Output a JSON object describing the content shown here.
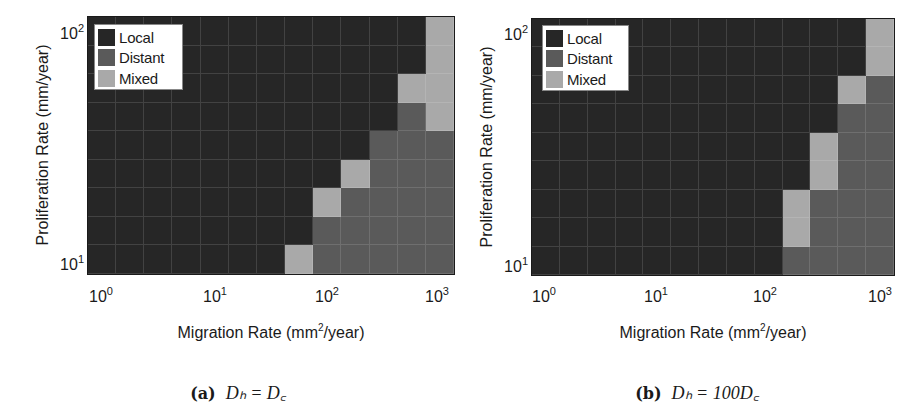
{
  "legend": {
    "items": [
      {
        "label": "Local",
        "color": "#262626",
        "key": "local"
      },
      {
        "label": "Distant",
        "color": "#5a5a5a",
        "key": "distant"
      },
      {
        "label": "Mixed",
        "color": "#a9a9a9",
        "key": "mixed"
      }
    ]
  },
  "panels": [
    {
      "id": "a",
      "caption_tag": "(a)",
      "caption_math": "Dₕ = D꜀",
      "caption_math_text": "D_h = D_c",
      "ylabel": "Proliferation Rate (mm/year)",
      "xlabel_pre": "Migration Rate (mm",
      "xlabel_sup": "2",
      "xlabel_post": "/year)",
      "xticks": [
        {
          "base": "10",
          "exp": "0"
        },
        {
          "base": "10",
          "exp": "1"
        },
        {
          "base": "10",
          "exp": "2"
        },
        {
          "base": "10",
          "exp": "3"
        }
      ],
      "yticks": [
        {
          "base": "10",
          "exp": "2"
        },
        {
          "base": "10",
          "exp": "1"
        }
      ]
    },
    {
      "id": "b",
      "caption_tag": "(b)",
      "caption_math": "Dₕ = 100D꜀",
      "caption_math_text": "D_h = 100 D_c",
      "ylabel": "Proliferation Rate (mm/year)",
      "xlabel_pre": "Migration Rate (mm",
      "xlabel_sup": "2",
      "xlabel_post": "/year)",
      "xticks": [
        {
          "base": "10",
          "exp": "0"
        },
        {
          "base": "10",
          "exp": "1"
        },
        {
          "base": "10",
          "exp": "2"
        },
        {
          "base": "10",
          "exp": "3"
        }
      ],
      "yticks": [
        {
          "base": "10",
          "exp": "2"
        },
        {
          "base": "10",
          "exp": "1"
        }
      ]
    }
  ],
  "chart_data": [
    {
      "type": "heatmap",
      "title": "(a) D_h = D_c",
      "xlabel": "Migration Rate (mm²/year)",
      "ylabel": "Proliferation Rate (mm/year)",
      "xscale": "log",
      "yscale": "log",
      "xlim": [
        1,
        1000
      ],
      "ylim": [
        10,
        100
      ],
      "xticks": [
        "10^0",
        "10^1",
        "10^2",
        "10^3"
      ],
      "yticks": [
        "10^1",
        "10^2"
      ],
      "legend": [
        "Local",
        "Distant",
        "Mixed"
      ],
      "legend_position": "upper left",
      "grid": true,
      "n_cols": 13,
      "n_rows": 9,
      "rows_top_to_bottom": [
        "LLLLLLLLLLLLM",
        "LLLLLLLLLLLLM",
        "LLLLLLLLLLLMM",
        "LLLLLLLLLLLDM",
        "LLLLLLLLLLDDD",
        "LLLLLLLLLMDDD",
        "LLLLLLLLMDDDD",
        "LLLLLLLLDDDDD",
        "LLLLLLLMDDDDD"
      ],
      "code": {
        "L": "Local",
        "D": "Distant",
        "M": "Mixed"
      }
    },
    {
      "type": "heatmap",
      "title": "(b) D_h = 100 D_c",
      "xlabel": "Migration Rate (mm²/year)",
      "ylabel": "Proliferation Rate (mm/year)",
      "xscale": "log",
      "yscale": "log",
      "xlim": [
        1,
        1000
      ],
      "ylim": [
        10,
        100
      ],
      "xticks": [
        "10^0",
        "10^1",
        "10^2",
        "10^3"
      ],
      "yticks": [
        "10^1",
        "10^2"
      ],
      "legend": [
        "Local",
        "Distant",
        "Mixed"
      ],
      "legend_position": "upper left",
      "grid": true,
      "n_cols": 13,
      "n_rows": 9,
      "rows_top_to_bottom": [
        "LLLLLLLLLLLLM",
        "LLLLLLLLLLLLM",
        "LLLLLLLLLLLMD",
        "LLLLLLLLLLLDD",
        "LLLLLLLLLLMDD",
        "LLLLLLLLLLMDD",
        "LLLLLLLLLMDDD",
        "LLLLLLLLLMDDD",
        "LLLLLLLLLDDDD"
      ],
      "code": {
        "L": "Local",
        "D": "Distant",
        "M": "Mixed"
      }
    }
  ]
}
